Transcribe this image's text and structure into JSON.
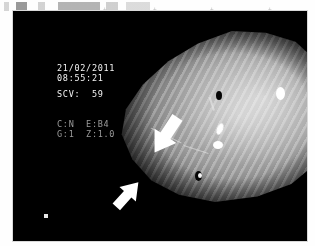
{
  "page": {
    "background_color": "#ffffff",
    "frame_color": "#000000"
  },
  "crop_marks": [
    "+",
    "+",
    "+",
    "+"
  ],
  "video_overlay": {
    "date": "21/02/2011",
    "time": "08:55:21",
    "scv_label": "SCV:",
    "scv_value": "59",
    "datetime_text": "21/02/2011\n08:55:21",
    "scv_text": "SCV:  59",
    "params_text": "C:N  E:B4\nG:1  Z:1.0",
    "param_color_mode_label": "C:N",
    "param_enhancement_label": "E:B4",
    "param_gain_label": "G:1",
    "param_zoom_label": "Z:1.0",
    "text_color": "#f2f2f2",
    "dim_text_color": "#9a9a9a"
  },
  "annotations": {
    "arrow_upper": {
      "name": "upper-annotation-arrow",
      "direction": "down-left",
      "color": "#ffffff"
    },
    "arrow_lower": {
      "name": "lower-annotation-arrow",
      "direction": "up-right",
      "color": "#ffffff"
    },
    "corner_marker": {
      "name": "white-square-marker",
      "color": "#e8e8e8"
    }
  },
  "image_content": {
    "modality": "endoscopy",
    "tissue_description": "mucosal surface with diagonal striping",
    "highlight_color": "#ffffff",
    "dark_spot_color": "#050505",
    "dark_spots": [
      {
        "x": 107,
        "y": 60,
        "w": 6,
        "h": 9
      },
      {
        "x": 86,
        "y": 140,
        "w": 7,
        "h": 10
      },
      {
        "x": 49,
        "y": 113,
        "w": 3,
        "h": 3
      }
    ],
    "highlights": [
      {
        "x": 167,
        "y": 56,
        "w": 9,
        "h": 13
      },
      {
        "x": 108,
        "y": 92,
        "w": 6,
        "h": 12
      },
      {
        "x": 104,
        "y": 110,
        "w": 10,
        "h": 8
      },
      {
        "x": 89,
        "y": 142,
        "w": 4,
        "h": 5
      }
    ]
  }
}
